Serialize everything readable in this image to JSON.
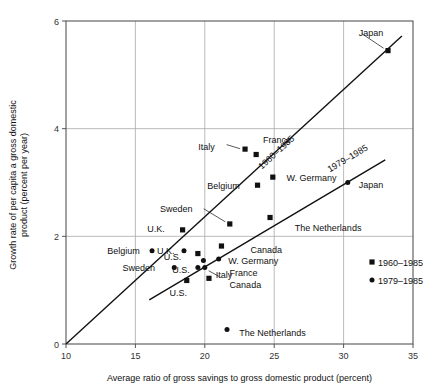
{
  "chart_data": {
    "type": "scatter",
    "title": "",
    "xlabel": "Average ratio of gross savings to gross domestic product (percent)",
    "ylabel_line1": "Growth rate of per capita a gross domestic",
    "ylabel_line2": "product (percent per year)",
    "xlim": [
      10,
      35
    ],
    "ylim": [
      0,
      6
    ],
    "xticks": [
      "10",
      "15",
      "20",
      "25",
      "30",
      "35"
    ],
    "xtick_values": [
      10,
      15,
      20,
      25,
      30,
      35
    ],
    "yticks": [
      "0",
      "2",
      "4",
      "6"
    ],
    "ytick_values": [
      0,
      2,
      4,
      6
    ],
    "grid": true,
    "legend_position": "inside-right",
    "legend": [
      {
        "label": "1960–1985",
        "marker": "square"
      },
      {
        "label": "1979–1985",
        "marker": "circle"
      }
    ],
    "series": [
      {
        "name": "1960–1985",
        "marker": "square",
        "points": [
          {
            "label": "Japan",
            "x": 33.2,
            "y": 5.45,
            "lx": 30.8,
            "ly": 5.78,
            "anchor": "start"
          },
          {
            "label": "France",
            "x": 23.7,
            "y": 3.52,
            "lx": 23.9,
            "ly": 3.8,
            "anchor": "start"
          },
          {
            "label": "Italy",
            "x": 22.9,
            "y": 3.62,
            "lx": 21.0,
            "ly": 3.66,
            "anchor": "end"
          },
          {
            "label": "W. Germany",
            "x": 24.9,
            "y": 3.1,
            "lx": 25.6,
            "ly": 3.1,
            "anchor": "start"
          },
          {
            "label": "Belgium",
            "x": 23.8,
            "y": 2.95,
            "lx": 22.8,
            "ly": 2.95,
            "anchor": "end"
          },
          {
            "label": "The Netherlands",
            "x": 24.7,
            "y": 2.35,
            "lx": 26.2,
            "ly": 2.17,
            "anchor": "start"
          },
          {
            "label": "Sweden",
            "x": 21.8,
            "y": 2.23,
            "lx": 19.4,
            "ly": 2.52,
            "anchor": "end"
          },
          {
            "label": "Canada",
            "x": 21.2,
            "y": 1.82,
            "lx": 23.0,
            "ly": 1.76,
            "anchor": "start"
          },
          {
            "label": "U.K.",
            "x": 18.4,
            "y": 2.12,
            "lx": 17.4,
            "ly": 2.14,
            "anchor": "end"
          },
          {
            "label": "U.S.",
            "x": 19.5,
            "y": 1.68,
            "lx": 18.6,
            "ly": 1.63,
            "anchor": "end"
          },
          {
            "label": "Italy",
            "x": 20.3,
            "y": 1.22,
            "lx": 20.5,
            "ly": 1.3,
            "anchor": "start"
          },
          {
            "label": "U.S.",
            "x": 18.7,
            "y": 1.18,
            "lx": 19.0,
            "ly": 0.95,
            "anchor": "end"
          }
        ]
      },
      {
        "name": "1979–1985",
        "marker": "circle",
        "points": [
          {
            "label": "Japan",
            "x": 30.3,
            "y": 3.0,
            "lx": 30.8,
            "ly": 2.96,
            "anchor": "start"
          },
          {
            "label": "W. Germany",
            "x": 21.0,
            "y": 1.58,
            "lx": 21.4,
            "ly": 1.56,
            "anchor": "start"
          },
          {
            "label": "France",
            "x": 19.9,
            "y": 1.55,
            "lx": 21.5,
            "ly": 1.33,
            "anchor": "start"
          },
          {
            "label": "Canada",
            "x": 20.0,
            "y": 1.42,
            "lx": 21.5,
            "ly": 1.1,
            "anchor": "start"
          },
          {
            "label": "Belgium",
            "x": 16.2,
            "y": 1.73,
            "lx": 15.6,
            "ly": 1.73,
            "anchor": "end"
          },
          {
            "label": "U.K.",
            "x": 18.5,
            "y": 1.73,
            "lx": 18.1,
            "ly": 1.73,
            "anchor": "end"
          },
          {
            "label": "Sweden",
            "x": 17.8,
            "y": 1.42,
            "lx": 16.7,
            "ly": 1.42,
            "anchor": "end"
          },
          {
            "label": "U.S.",
            "x": 19.5,
            "y": 1.42,
            "lx": 19.2,
            "ly": 1.38,
            "anchor": "end"
          },
          {
            "label": "The Netherlands",
            "x": 21.6,
            "y": 0.27,
            "lx": 22.2,
            "ly": 0.22,
            "anchor": "start"
          }
        ]
      }
    ],
    "trend_lines": [
      {
        "label": "1960–1985",
        "x1": 10.0,
        "y1": 0.0,
        "x2": 34.2,
        "y2": 5.72,
        "lx": 25.3,
        "ly": 3.52
      },
      {
        "label": "1979–1985",
        "x1": 16.0,
        "y1": 0.82,
        "x2": 33.0,
        "y2": 3.42,
        "lx": 30.4,
        "ly": 3.4
      }
    ]
  },
  "legend_items": [
    {
      "label": "1960–1985"
    },
    {
      "label": "1979–1985"
    }
  ]
}
